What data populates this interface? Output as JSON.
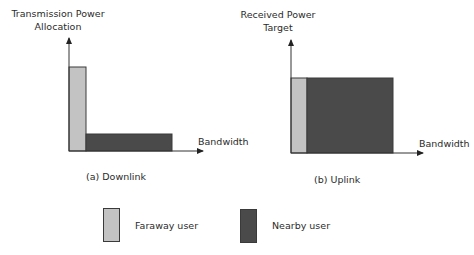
{
  "colors": {
    "faraway": "#c3c3c3",
    "nearby": "#4a4a4a",
    "axis": "#333333",
    "outline": "#3a3a3a"
  },
  "downlink": {
    "ylabel_line1": "Transmission Power",
    "ylabel_line2": "Allocation",
    "xlabel": "Bandwidth",
    "caption": "(a) Downlink",
    "bars": [
      {
        "user": "Faraway user",
        "bandwidth_share": "narrow",
        "level": "high"
      },
      {
        "user": "Nearby user",
        "bandwidth_share": "wide",
        "level": "low"
      }
    ]
  },
  "uplink": {
    "ylabel_line1": "Received Power",
    "ylabel_line2": "Target",
    "xlabel": "Bandwidth",
    "caption": "(b) Uplink",
    "bars": [
      {
        "user": "Faraway user",
        "bandwidth_share": "narrow",
        "level": "equal"
      },
      {
        "user": "Nearby user",
        "bandwidth_share": "wide",
        "level": "equal"
      }
    ]
  },
  "legend": {
    "items": [
      {
        "label": "Faraway user"
      },
      {
        "label": "Nearby user"
      }
    ]
  }
}
